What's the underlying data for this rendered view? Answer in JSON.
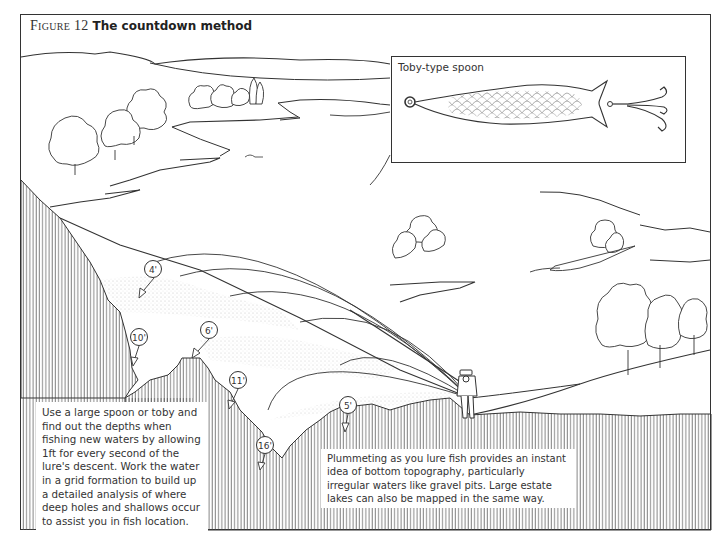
{
  "figure": {
    "label": "Figure 12",
    "title": "The countdown method"
  },
  "inset": {
    "label": "Toby-type spoon",
    "icon": "spoon-lure-icon"
  },
  "depth_markers": [
    {
      "label": "4'",
      "x": 144,
      "y": 279
    },
    {
      "label": "10'",
      "x": 130,
      "y": 330
    },
    {
      "label": "6'",
      "x": 200,
      "y": 323
    },
    {
      "label": "11'",
      "x": 229,
      "y": 372
    },
    {
      "label": "5'",
      "x": 339,
      "y": 398
    },
    {
      "label": "16'",
      "x": 256,
      "y": 437
    }
  ],
  "captions": {
    "left": "Use a large spoon or toby and find out the depths when fishing new waters by allowing 1ft for every second of the lure's descent. Work the water in a grid formation to build up a detailed analysis of where deep holes and shallows occur to assist you in fish location.",
    "right": "Plummeting as you lure fish provides an instant idea of bottom topography, particularly irregular waters like gravel pits. Large estate lakes can also be mapped in the same way."
  },
  "colors": {
    "line": "#333333",
    "hatch": "#555555",
    "background": "#ffffff"
  }
}
